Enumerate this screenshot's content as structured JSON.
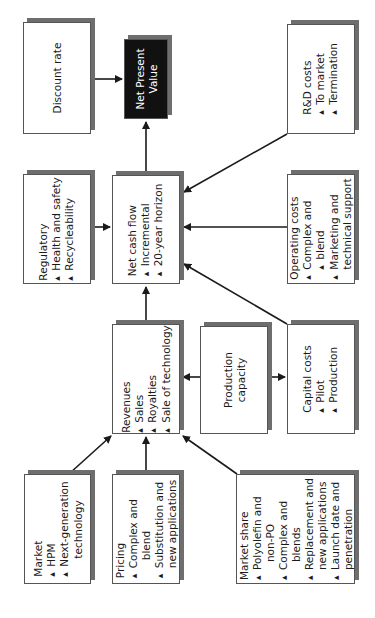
{
  "diagram": {
    "type": "flowchart",
    "orientation": "rotated-90-ccw",
    "nodes": {
      "discount_rate": {
        "title": "Discount rate",
        "items": []
      },
      "npv": {
        "title_line1": "Net Present",
        "title_line2": "Value",
        "items": []
      },
      "rd_costs": {
        "title": "R&D costs",
        "items": [
          "To market",
          "Termination"
        ]
      },
      "regulatory": {
        "title": "Regulatory",
        "items": [
          "Health and safety",
          "Recycleability"
        ]
      },
      "net_cash_flow": {
        "title": "Net cash flow",
        "items": [
          "Incremental",
          "20-year horizon"
        ]
      },
      "operating_costs": {
        "title": "Operating costs",
        "items": [
          "Complex and",
          "blend",
          "Marketing and",
          "technical support"
        ]
      },
      "revenues": {
        "title": "Revenues",
        "items": [
          "Sales",
          "Royalties",
          "Sale of technology"
        ]
      },
      "production_capacity": {
        "title_line1": "Production",
        "title_line2": "capacity",
        "items": []
      },
      "capital_costs": {
        "title": "Capital costs",
        "items": [
          "Pilot",
          "Production"
        ]
      },
      "market": {
        "title": "Market",
        "items": [
          "HPM",
          "Next-generation",
          "technology"
        ]
      },
      "pricing": {
        "title": "Pricing",
        "items": [
          "Complex and",
          "blend",
          "Substitution and",
          "new applications"
        ]
      },
      "market_share": {
        "title": "Market share",
        "items": [
          "Polyolefin and",
          "non-PO",
          "Complex and",
          "blends",
          "Replacement and",
          "new applications",
          "Launch date and",
          "penetration"
        ]
      }
    },
    "edges": [
      {
        "from": "discount_rate",
        "to": "npv"
      },
      {
        "from": "net_cash_flow",
        "to": "npv"
      },
      {
        "from": "regulatory",
        "to": "net_cash_flow"
      },
      {
        "from": "rd_costs",
        "to": "net_cash_flow"
      },
      {
        "from": "operating_costs",
        "to": "net_cash_flow"
      },
      {
        "from": "capital_costs",
        "to": "net_cash_flow"
      },
      {
        "from": "revenues",
        "to": "net_cash_flow"
      },
      {
        "from": "production_capacity",
        "to": "revenues"
      },
      {
        "from": "production_capacity",
        "to": "capital_costs"
      },
      {
        "from": "market",
        "to": "revenues"
      },
      {
        "from": "pricing",
        "to": "revenues"
      },
      {
        "from": "market_share",
        "to": "revenues"
      }
    ],
    "colors": {
      "box_fill": "#ffffff",
      "box_shadow": "#6e6e6e",
      "npv_fill": "#111111",
      "npv_text": "#ffffff",
      "arrow": "#1a1a1a"
    }
  }
}
